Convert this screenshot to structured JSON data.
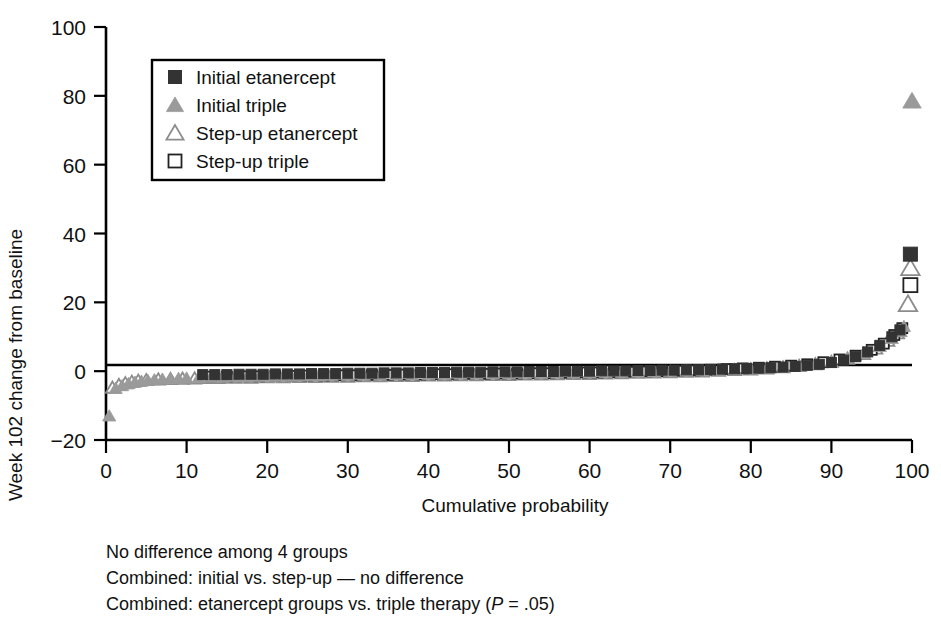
{
  "figure": {
    "title": "",
    "background": "#ffffff"
  },
  "chart_data": {
    "type": "scatter",
    "title": "",
    "xlabel": "Cumulative probability",
    "ylabel": "Week 102 change from baseline",
    "xlim": [
      0,
      100
    ],
    "ylim": [
      -20,
      100
    ],
    "xticks": [
      0,
      10,
      20,
      30,
      40,
      50,
      60,
      70,
      80,
      90,
      100
    ],
    "yticks": [
      -20,
      0,
      20,
      40,
      60,
      80,
      100
    ],
    "xticklabels": [
      "0",
      "10",
      "20",
      "30",
      "40",
      "50",
      "60",
      "70",
      "80",
      "90",
      "100"
    ],
    "yticklabels": [
      "−20",
      "0",
      "20",
      "40",
      "60",
      "80",
      "100"
    ],
    "grid": false,
    "zero_reference_line": true,
    "legend_position": "upper-left-inside",
    "series": [
      {
        "name": "Initial etanercept",
        "marker": "filled-square",
        "color": "#333333",
        "points": [
          [
            12.0,
            -1.0
          ],
          [
            13.5,
            -1.0
          ],
          [
            15.0,
            -1.0
          ],
          [
            16.5,
            -0.9
          ],
          [
            18.0,
            -0.9
          ],
          [
            19.5,
            -0.9
          ],
          [
            21.0,
            -0.8
          ],
          [
            22.5,
            -0.8
          ],
          [
            24.0,
            -0.8
          ],
          [
            25.5,
            -0.7
          ],
          [
            27.0,
            -0.7
          ],
          [
            28.5,
            -0.7
          ],
          [
            30.0,
            -0.6
          ],
          [
            31.5,
            -0.6
          ],
          [
            33.0,
            -0.6
          ],
          [
            34.5,
            -0.5
          ],
          [
            36.0,
            -0.5
          ],
          [
            37.5,
            -0.5
          ],
          [
            39.0,
            -0.4
          ],
          [
            40.5,
            -0.4
          ],
          [
            42.0,
            -0.4
          ],
          [
            43.5,
            -0.3
          ],
          [
            45.0,
            -0.3
          ],
          [
            46.5,
            -0.3
          ],
          [
            48.0,
            -0.2
          ],
          [
            49.5,
            -0.2
          ],
          [
            51.0,
            -0.2
          ],
          [
            52.5,
            -0.1
          ],
          [
            54.0,
            -0.1
          ],
          [
            55.5,
            -0.1
          ],
          [
            57.0,
            0.0
          ],
          [
            58.5,
            0.0
          ],
          [
            60.0,
            0.0
          ],
          [
            61.5,
            0.1
          ],
          [
            63.0,
            0.1
          ],
          [
            64.5,
            0.1
          ],
          [
            66.0,
            0.2
          ],
          [
            67.5,
            0.2
          ],
          [
            69.0,
            0.3
          ],
          [
            70.5,
            0.3
          ],
          [
            72.0,
            0.4
          ],
          [
            73.5,
            0.4
          ],
          [
            75.0,
            0.5
          ],
          [
            76.5,
            0.6
          ],
          [
            78.0,
            0.7
          ],
          [
            79.5,
            0.8
          ],
          [
            81.0,
            0.9
          ],
          [
            82.5,
            1.0
          ],
          [
            84.0,
            1.2
          ],
          [
            85.5,
            1.4
          ],
          [
            87.0,
            1.7
          ],
          [
            88.5,
            2.0
          ],
          [
            90.0,
            2.5
          ],
          [
            91.5,
            3.2
          ],
          [
            93.0,
            4.2
          ],
          [
            94.5,
            5.6
          ],
          [
            96.0,
            7.5
          ],
          [
            97.5,
            10.0
          ],
          [
            98.5,
            12.0
          ],
          [
            99.8,
            34.0
          ]
        ]
      },
      {
        "name": "Initial triple",
        "marker": "filled-triangle",
        "color": "#9a9a9a",
        "points": [
          [
            0.4,
            -13.0
          ],
          [
            1.2,
            -5.0
          ],
          [
            2.0,
            -4.2
          ],
          [
            2.8,
            -3.6
          ],
          [
            3.6,
            -3.2
          ],
          [
            4.4,
            -2.9
          ],
          [
            5.2,
            -2.7
          ],
          [
            6.0,
            -2.5
          ],
          [
            7.0,
            -2.3
          ],
          [
            8.0,
            -2.2
          ],
          [
            9.0,
            -2.1
          ],
          [
            10.0,
            -2.0
          ],
          [
            11.5,
            -1.9
          ],
          [
            13.0,
            -1.8
          ],
          [
            14.5,
            -1.8
          ],
          [
            16.0,
            -1.7
          ],
          [
            17.5,
            -1.7
          ],
          [
            19.0,
            -1.6
          ],
          [
            20.5,
            -1.6
          ],
          [
            22.0,
            -1.5
          ],
          [
            23.5,
            -1.5
          ],
          [
            25.0,
            -1.4
          ],
          [
            26.5,
            -1.4
          ],
          [
            28.0,
            -1.3
          ],
          [
            30.0,
            -1.3
          ],
          [
            32.0,
            -1.2
          ],
          [
            34.0,
            -1.2
          ],
          [
            36.0,
            -1.1
          ],
          [
            38.0,
            -1.1
          ],
          [
            40.0,
            -1.0
          ],
          [
            42.0,
            -1.0
          ],
          [
            44.0,
            -0.9
          ],
          [
            46.0,
            -0.9
          ],
          [
            48.0,
            -0.8
          ],
          [
            50.0,
            -0.8
          ],
          [
            52.0,
            -0.7
          ],
          [
            54.0,
            -0.7
          ],
          [
            56.0,
            -0.6
          ],
          [
            58.0,
            -0.6
          ],
          [
            60.0,
            -0.5
          ],
          [
            62.0,
            -0.4
          ],
          [
            64.0,
            -0.4
          ],
          [
            66.0,
            -0.3
          ],
          [
            68.0,
            -0.2
          ],
          [
            70.0,
            -0.1
          ],
          [
            72.0,
            0.0
          ],
          [
            74.0,
            0.1
          ],
          [
            76.0,
            0.3
          ],
          [
            78.0,
            0.5
          ],
          [
            80.0,
            0.7
          ],
          [
            82.0,
            0.9
          ],
          [
            84.0,
            1.2
          ],
          [
            86.0,
            1.6
          ],
          [
            88.0,
            2.1
          ],
          [
            90.0,
            2.8
          ],
          [
            92.0,
            3.8
          ],
          [
            94.0,
            5.2
          ],
          [
            96.0,
            7.2
          ],
          [
            97.5,
            9.5
          ],
          [
            98.6,
            11.5
          ],
          [
            99.0,
            13.0
          ],
          [
            100.0,
            78.5
          ]
        ]
      },
      {
        "name": "Step-up etanercept",
        "marker": "open-triangle",
        "color": "#8c8c8c",
        "points": [
          [
            0.8,
            -4.8
          ],
          [
            1.6,
            -4.0
          ],
          [
            2.4,
            -3.5
          ],
          [
            3.2,
            -3.1
          ],
          [
            4.0,
            -2.8
          ],
          [
            5.0,
            -2.6
          ],
          [
            6.5,
            -2.4
          ],
          [
            8.0,
            -2.3
          ],
          [
            9.5,
            -2.2
          ],
          [
            11.0,
            -2.1
          ],
          [
            12.5,
            -2.0
          ],
          [
            14.0,
            -2.0
          ],
          [
            16.0,
            -1.9
          ],
          [
            18.0,
            -1.9
          ],
          [
            20.0,
            -1.8
          ],
          [
            22.0,
            -1.8
          ],
          [
            24.0,
            -1.7
          ],
          [
            26.0,
            -1.7
          ],
          [
            28.0,
            -1.6
          ],
          [
            30.0,
            -1.6
          ],
          [
            32.0,
            -1.5
          ],
          [
            34.0,
            -1.5
          ],
          [
            36.0,
            -1.4
          ],
          [
            38.0,
            -1.4
          ],
          [
            40.0,
            -1.3
          ],
          [
            42.0,
            -1.3
          ],
          [
            44.0,
            -1.2
          ],
          [
            46.0,
            -1.2
          ],
          [
            48.0,
            -1.1
          ],
          [
            50.0,
            -1.1
          ],
          [
            52.0,
            -1.0
          ],
          [
            54.0,
            -1.0
          ],
          [
            56.0,
            -0.9
          ],
          [
            58.0,
            -0.8
          ],
          [
            60.0,
            -0.8
          ],
          [
            62.0,
            -0.7
          ],
          [
            64.0,
            -0.6
          ],
          [
            66.0,
            -0.5
          ],
          [
            68.0,
            -0.4
          ],
          [
            70.0,
            -0.3
          ],
          [
            72.0,
            -0.2
          ],
          [
            74.0,
            -0.1
          ],
          [
            76.0,
            0.1
          ],
          [
            78.0,
            0.3
          ],
          [
            80.0,
            0.5
          ],
          [
            82.0,
            0.8
          ],
          [
            84.0,
            1.1
          ],
          [
            86.0,
            1.5
          ],
          [
            88.0,
            2.0
          ],
          [
            90.0,
            2.7
          ],
          [
            92.0,
            3.6
          ],
          [
            94.0,
            5.0
          ],
          [
            95.5,
            6.6
          ],
          [
            97.0,
            8.8
          ],
          [
            98.2,
            11.0
          ],
          [
            99.5,
            19.5
          ],
          [
            99.8,
            30.0
          ]
        ]
      },
      {
        "name": "Step-up triple",
        "marker": "open-square",
        "color": "#222222",
        "points": [
          [
            13.0,
            -1.6
          ],
          [
            15.0,
            -1.6
          ],
          [
            17.0,
            -1.5
          ],
          [
            19.0,
            -1.5
          ],
          [
            21.0,
            -1.4
          ],
          [
            23.0,
            -1.4
          ],
          [
            25.0,
            -1.3
          ],
          [
            27.0,
            -1.3
          ],
          [
            29.0,
            -1.2
          ],
          [
            31.0,
            -1.2
          ],
          [
            33.0,
            -1.1
          ],
          [
            35.0,
            -1.1
          ],
          [
            37.0,
            -1.0
          ],
          [
            39.0,
            -1.0
          ],
          [
            41.0,
            -0.9
          ],
          [
            43.0,
            -0.9
          ],
          [
            45.0,
            -0.8
          ],
          [
            47.0,
            -0.8
          ],
          [
            49.0,
            -0.7
          ],
          [
            51.0,
            -0.7
          ],
          [
            53.0,
            -0.6
          ],
          [
            55.0,
            -0.6
          ],
          [
            57.0,
            -0.5
          ],
          [
            59.0,
            -0.4
          ],
          [
            61.0,
            -0.4
          ],
          [
            63.0,
            -0.3
          ],
          [
            65.0,
            -0.2
          ],
          [
            67.0,
            -0.1
          ],
          [
            69.0,
            0.0
          ],
          [
            71.0,
            0.1
          ],
          [
            73.0,
            0.2
          ],
          [
            75.0,
            0.4
          ],
          [
            77.0,
            0.6
          ],
          [
            79.0,
            0.8
          ],
          [
            81.0,
            1.0
          ],
          [
            83.0,
            1.3
          ],
          [
            85.0,
            1.6
          ],
          [
            87.0,
            2.0
          ],
          [
            89.0,
            2.6
          ],
          [
            91.0,
            3.4
          ],
          [
            93.0,
            4.5
          ],
          [
            95.0,
            6.2
          ],
          [
            96.5,
            8.0
          ],
          [
            97.8,
            10.5
          ],
          [
            98.8,
            12.5
          ],
          [
            99.8,
            25.0
          ]
        ]
      }
    ],
    "outliers": [
      {
        "series": "Initial triple",
        "x": 0.4,
        "y": -13.0,
        "note": "lowest value"
      },
      {
        "series": "Initial triple",
        "x": 100.0,
        "y": 78.5,
        "note": "highest value"
      }
    ]
  },
  "legend": {
    "items": [
      {
        "label": "Initial etanercept",
        "marker": "filled-square",
        "color": "#333333"
      },
      {
        "label": "Initial triple",
        "marker": "filled-triangle",
        "color": "#9a9a9a"
      },
      {
        "label": "Step-up etanercept",
        "marker": "open-triangle",
        "color": "#8c8c8c"
      },
      {
        "label": "Step-up triple",
        "marker": "open-square",
        "color": "#222222"
      }
    ]
  },
  "notes": {
    "lines": [
      {
        "text": "No difference among 4 groups",
        "italic_token": ""
      },
      {
        "text": "Combined: initial vs. step-up — no difference",
        "italic_token": ""
      },
      {
        "text_pre": "Combined: etanercept groups vs. triple therapy (",
        "italic_token": "P",
        "text_post": " = .05)"
      }
    ],
    "line1": "No difference among 4 groups",
    "line2": "Combined: initial vs. step-up — no difference",
    "line3_pre": "Combined: etanercept groups vs. triple therapy (",
    "line3_italic": "P",
    "line3_post": " = .05)"
  }
}
